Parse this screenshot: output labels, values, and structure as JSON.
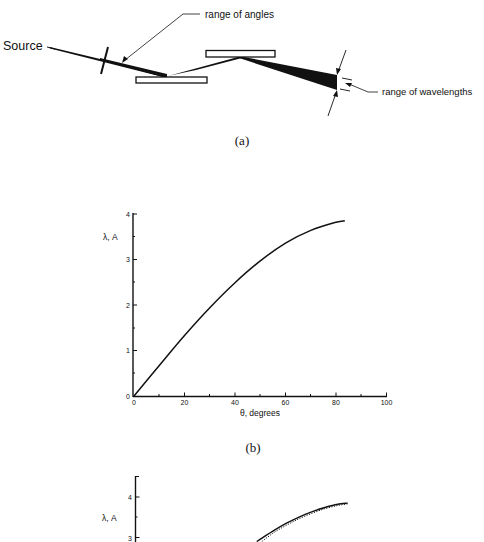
{
  "figure_a": {
    "caption": "(a)",
    "labels": {
      "source": "Source",
      "range_of_angles": "range of angles",
      "range_of_wavelengths": "range of wavelengths"
    },
    "elements": [
      "aperture-slit",
      "crystal-1",
      "crystal-2",
      "x-ray-beam"
    ]
  },
  "figure_b": {
    "caption": "(b)"
  },
  "chart_data": [
    {
      "id": "b",
      "type": "line",
      "title": "",
      "xlabel": "θ, degrees",
      "ylabel": "λ, A",
      "xlim": [
        0,
        100
      ],
      "ylim": [
        0,
        4
      ],
      "x_ticks": [
        "0",
        "20",
        "40",
        "60",
        "80",
        "100"
      ],
      "y_ticks": [
        "0",
        "1",
        "2",
        "3",
        "4"
      ],
      "grid": false,
      "legend": null,
      "series": [
        {
          "name": "λ vs θ",
          "style": "solid",
          "x": [
            0,
            10,
            20,
            30,
            40,
            50,
            60,
            70,
            80,
            83.5
          ],
          "y": [
            0,
            0.67,
            1.33,
            1.94,
            2.49,
            2.97,
            3.36,
            3.64,
            3.82,
            3.85
          ]
        }
      ]
    },
    {
      "id": "c",
      "type": "line",
      "title": "",
      "xlabel": "",
      "ylabel": "λ, A",
      "ylim_visible": [
        2.9,
        4.5
      ],
      "y_ticks": [
        "3",
        "4"
      ],
      "grid": false,
      "legend": null,
      "series": [
        {
          "name": "solid curve",
          "style": "solid",
          "x": [
            48,
            55,
            60,
            65,
            70,
            75,
            80,
            84
          ],
          "y": [
            2.9,
            3.18,
            3.36,
            3.51,
            3.64,
            3.74,
            3.82,
            3.85
          ]
        },
        {
          "name": "dotted curve",
          "style": "dotted",
          "x": [
            50,
            55,
            60,
            65,
            70,
            75,
            80,
            84
          ],
          "y": [
            2.9,
            3.13,
            3.31,
            3.47,
            3.6,
            3.71,
            3.79,
            3.83
          ]
        }
      ]
    }
  ]
}
